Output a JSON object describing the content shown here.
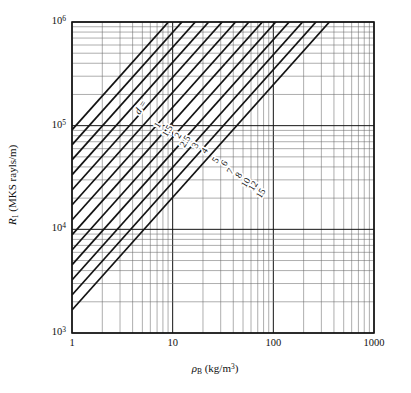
{
  "figure": {
    "kind": "log-log-nomograph",
    "background": "#ffffff",
    "ink_color": "#141414",
    "grid_color": "#6b6b6b",
    "frame_color": "#141414"
  },
  "axes": {
    "x": {
      "label_prefix": "ρ",
      "label_sub": "B",
      "label_unit": "(kg/m",
      "label_unit_sup": "3",
      "label_unit_close": ")",
      "label_full": "ρB (kg/m3)",
      "scale": "log10",
      "min": 1,
      "max": 1000,
      "decade_ticks": [
        1,
        10,
        100,
        1000
      ],
      "tick_labels": [
        "1",
        "10",
        "100",
        "1000"
      ],
      "minor_per_decade": [
        2,
        3,
        4,
        5,
        6,
        7,
        8,
        9
      ]
    },
    "y": {
      "label_prefix": "R",
      "label_sub": "1",
      "label_unit": "(MKS rayls/m)",
      "label_full": "R1 (MKS rayls/m)",
      "scale": "log10",
      "min": 1000,
      "max": 1000000,
      "decade_ticks": [
        1000,
        10000,
        100000,
        1000000
      ],
      "tick_labels": [
        "10",
        "10",
        "10",
        "10"
      ],
      "tick_exponents": [
        "3",
        "4",
        "5",
        "6"
      ],
      "minor_per_decade": [
        2,
        3,
        4,
        5,
        6,
        7,
        8,
        9
      ]
    }
  },
  "plot_box": {
    "left": 72,
    "top": 22,
    "right": 374,
    "bottom": 333,
    "width": 302,
    "height": 311
  },
  "annotations": {
    "family_label": "d =",
    "family_label_italic": true
  },
  "chart_data": {
    "type": "line",
    "title": "",
    "xlabel": "ρB (kg/m3)",
    "ylabel": "R1 (MKS rayls/m)",
    "xscale": "log",
    "yscale": "log",
    "xlim": [
      1,
      1000
    ],
    "ylim": [
      1000,
      1000000
    ],
    "grid": true,
    "grid_style": "log-log minor grid, both axes",
    "legend": "inline curve labels along the band of lines",
    "parameter_name": "d",
    "parameter_unit": "µm (fiber diameter)",
    "slope_log_log": 1.53,
    "series": [
      {
        "name": "1",
        "label": "1",
        "d": 1.0,
        "anchor_x": 7.2,
        "anchor_y": 100000,
        "values": [
          {
            "x": 1,
            "y": 1670
          },
          {
            "x": 1000,
            "y": 3030000
          }
        ]
      },
      {
        "name": "1.5",
        "label": "1.5",
        "d": 1.5,
        "anchor_x": 9.0,
        "anchor_y": 88000,
        "values": [
          {
            "x": 1,
            "y": 2330
          },
          {
            "x": 1000,
            "y": 4230000
          }
        ]
      },
      {
        "name": "2",
        "label": "2",
        "d": 2.0,
        "anchor_x": 11.5,
        "anchor_y": 80000,
        "values": [
          {
            "x": 1,
            "y": 3250
          },
          {
            "x": 1000,
            "y": 5900000
          }
        ]
      },
      {
        "name": "2.5",
        "label": "2.5",
        "d": 2.5,
        "anchor_x": 13.5,
        "anchor_y": 70000,
        "values": [
          {
            "x": 1,
            "y": 4540
          },
          {
            "x": 1000,
            "y": 8240000
          }
        ]
      },
      {
        "name": "3",
        "label": "3",
        "d": 3.0,
        "anchor_x": 17.0,
        "anchor_y": 64000,
        "values": [
          {
            "x": 1,
            "y": 6330
          },
          {
            "x": 1000,
            "y": 11500000
          }
        ]
      },
      {
        "name": "4",
        "label": "4",
        "d": 4.0,
        "anchor_x": 21.0,
        "anchor_y": 57000,
        "values": [
          {
            "x": 1,
            "y": 8840
          },
          {
            "x": 1000,
            "y": 16000000
          }
        ]
      },
      {
        "name": "5",
        "label": "5",
        "d": 5.0,
        "anchor_x": 27.0,
        "anchor_y": 46000,
        "values": [
          {
            "x": 1,
            "y": 12300
          },
          {
            "x": 1000,
            "y": 22400000
          }
        ]
      },
      {
        "name": "6",
        "label": "6",
        "d": 6.0,
        "anchor_x": 33.0,
        "anchor_y": 43000,
        "values": [
          {
            "x": 1,
            "y": 17200
          },
          {
            "x": 1000,
            "y": 31200000
          }
        ]
      },
      {
        "name": "7",
        "label": "7",
        "d": 7.0,
        "anchor_x": 38.0,
        "anchor_y": 36000,
        "values": [
          {
            "x": 1,
            "y": 24000
          },
          {
            "x": 1000,
            "y": 43600000
          }
        ]
      },
      {
        "name": "8",
        "label": "8",
        "d": 8.0,
        "anchor_x": 46.0,
        "anchor_y": 33000,
        "values": [
          {
            "x": 1,
            "y": 33500
          },
          {
            "x": 1000,
            "y": 60800000
          }
        ]
      },
      {
        "name": "10",
        "label": "10",
        "d": 10.0,
        "anchor_x": 54.0,
        "anchor_y": 28000,
        "values": [
          {
            "x": 1,
            "y": 46800
          },
          {
            "x": 1000,
            "y": 84900000
          }
        ]
      },
      {
        "name": "12",
        "label": "12",
        "d": 12.0,
        "anchor_x": 64.0,
        "anchor_y": 26000,
        "values": [
          {
            "x": 1,
            "y": 65300
          },
          {
            "x": 1000,
            "y": 118000000
          }
        ]
      },
      {
        "name": "15",
        "label": "15",
        "d": 15.0,
        "anchor_x": 76.0,
        "anchor_y": 22000,
        "values": [
          {
            "x": 1,
            "y": 91100
          },
          {
            "x": 1000,
            "y": 165000000
          }
        ]
      }
    ]
  }
}
